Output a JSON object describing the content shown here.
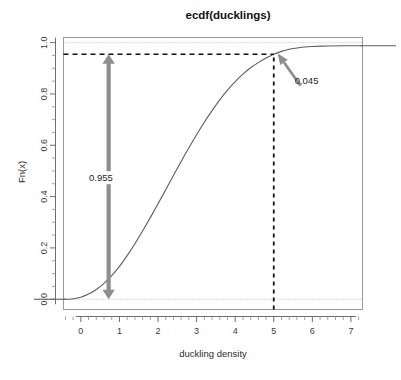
{
  "chart_data": {
    "type": "line",
    "title": "ecdf(ducklings)",
    "xlabel": "duckling density",
    "ylabel": "Fn(x)",
    "xlim": [
      -0.45,
      7.3
    ],
    "ylim": [
      -0.04,
      1.02
    ],
    "grid": false,
    "legend": null,
    "x_ticks": [
      0,
      1,
      2,
      3,
      4,
      5,
      6,
      7
    ],
    "x_tick_labels": [
      "0",
      "1",
      "2",
      "3",
      "4",
      "5",
      "6",
      "7"
    ],
    "x_minor_step": 0.2,
    "y_ticks": [
      0.0,
      0.2,
      0.4,
      0.6,
      0.8,
      1.0
    ],
    "y_tick_labels": [
      "0.0",
      "0.2",
      "0.4",
      "0.6",
      "0.8",
      "1.0"
    ],
    "y_minor_step": 0.05,
    "series": [
      {
        "name": "ecdf(ducklings)",
        "color": "#5d5d5d",
        "x": [
          -0.45,
          -0.3,
          -0.15,
          0.0,
          0.2,
          0.4,
          0.6,
          0.8,
          1.0,
          1.2,
          1.4,
          1.6,
          1.8,
          2.0,
          2.2,
          2.4,
          2.6,
          2.8,
          3.0,
          3.2,
          3.4,
          3.6,
          3.8,
          4.0,
          4.2,
          4.4,
          4.6,
          4.8,
          5.0,
          5.2,
          5.4,
          5.6,
          5.8,
          6.0,
          6.4,
          6.8,
          7.3
        ],
        "y": [
          0.0,
          0.0,
          0.003,
          0.008,
          0.02,
          0.038,
          0.062,
          0.092,
          0.128,
          0.17,
          0.216,
          0.266,
          0.318,
          0.372,
          0.427,
          0.482,
          0.537,
          0.59,
          0.641,
          0.69,
          0.735,
          0.777,
          0.815,
          0.848,
          0.877,
          0.902,
          0.922,
          0.94,
          0.955,
          0.966,
          0.974,
          0.979,
          0.983,
          0.985,
          0.987,
          0.988,
          0.988
        ]
      }
    ],
    "reference_lines": [
      {
        "name": "upper-bound-dotted",
        "orientation": "horizontal",
        "value": 1.0,
        "style": "dotted",
        "color": "#b4b4b4"
      },
      {
        "name": "lower-bound-dotted",
        "orientation": "horizontal",
        "value": 0.0,
        "style": "dotted",
        "color": "#b4b4b4"
      },
      {
        "name": "probability-level",
        "orientation": "horizontal",
        "value": 0.955,
        "style": "dashed",
        "color": "#111111"
      },
      {
        "name": "density-threshold",
        "orientation": "vertical",
        "value": 5.0,
        "style": "dashed",
        "color": "#111111"
      }
    ],
    "annotations": [
      {
        "name": "lower-tail-proportion",
        "label": "0.955",
        "value": 0.955,
        "kind": "double-arrow",
        "x": 0.72,
        "y_from": 0.0,
        "y_to": 0.955,
        "label_x": 0.52,
        "label_y": 0.46,
        "color": "#8e8e8e"
      },
      {
        "name": "upper-tail-proportion",
        "label": "0.045",
        "value": 0.045,
        "kind": "pointer-arrow",
        "target_x": 5.1,
        "target_y": 0.958,
        "label_x": 5.85,
        "label_y": 0.84,
        "color": "#8e8e8e"
      }
    ]
  }
}
